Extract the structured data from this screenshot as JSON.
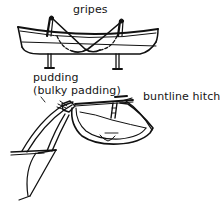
{
  "diagram": {
    "labels": {
      "gripes": "gripes",
      "pudding": "pudding",
      "pudding_note": "(bulky padding)",
      "buntline_hitch": "buntline hitch"
    },
    "figures": [
      {
        "name": "boat-on-chocks",
        "description": "lifeboat resting on chocks secured by crossed gripes"
      },
      {
        "name": "boat-on-davit",
        "description": "lifeboat hanging from davit with pudding and buntline hitch"
      }
    ],
    "colors": {
      "line": "#111111",
      "background": "#ffffff"
    }
  }
}
